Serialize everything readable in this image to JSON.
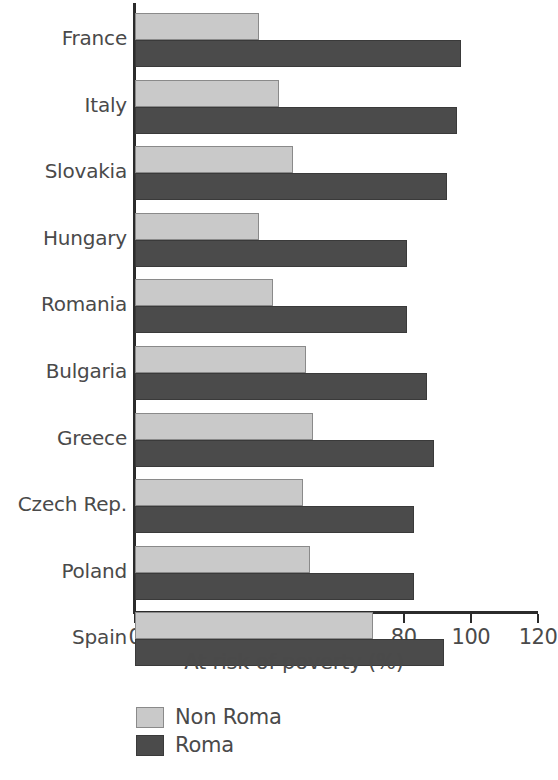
{
  "chart_data": {
    "type": "bar",
    "orientation": "horizontal",
    "title": "",
    "xlabel": "At risk of poverty (%)",
    "ylabel": "",
    "xlim": [
      0,
      120
    ],
    "xticks": [
      0,
      20,
      40,
      60,
      80,
      100,
      120
    ],
    "grid": false,
    "legend_position": "bottom-left",
    "categories": [
      "France",
      "Italy",
      "Slovakia",
      "Hungary",
      "Romania",
      "Bulgaria",
      "Greece",
      "Czech Rep.",
      "Poland",
      "Spain"
    ],
    "series": [
      {
        "name": "Non Roma",
        "color": "#c9c9c9",
        "values": [
          37,
          43,
          47,
          37,
          41,
          51,
          53,
          50,
          52,
          71
        ]
      },
      {
        "name": "Roma",
        "color": "#4b4b4b",
        "values": [
          97,
          96,
          93,
          81,
          81,
          87,
          89,
          83,
          83,
          92
        ]
      }
    ]
  },
  "legend": {
    "items": [
      {
        "label": "Non Roma",
        "swatch": "light"
      },
      {
        "label": "Roma",
        "swatch": "dark"
      }
    ]
  }
}
